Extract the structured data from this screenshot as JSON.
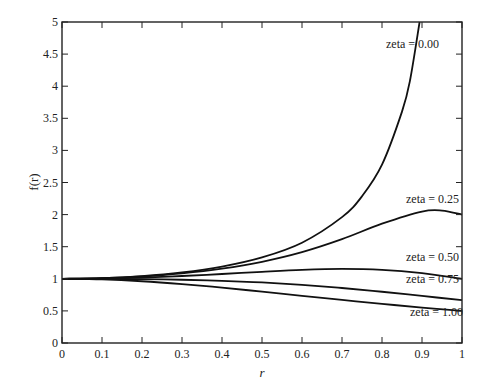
{
  "chart_data": {
    "type": "line",
    "title": "",
    "xlabel": "r",
    "ylabel": "f(r)",
    "xlim": [
      0,
      1
    ],
    "ylim": [
      0,
      5
    ],
    "grid": false,
    "legend": "inline labels near curves (right side)",
    "x_ticks": [
      "0",
      "0.1",
      "0.2",
      "0.3",
      "0.4",
      "0.5",
      "0.6",
      "0.7",
      "0.8",
      "0.9",
      "1"
    ],
    "y_ticks": [
      "0",
      "0.5",
      "1",
      "1.5",
      "2",
      "2.5",
      "3",
      "3.5",
      "4",
      "4.5",
      "5"
    ],
    "x": [
      0,
      0.1,
      0.2,
      0.3,
      0.4,
      0.5,
      0.6,
      0.7,
      0.8,
      0.9,
      1.0
    ],
    "series": [
      {
        "name": "zeta = 0.00",
        "x": [
          0,
          0.1,
          0.2,
          0.3,
          0.4,
          0.5,
          0.6,
          0.7,
          0.75,
          0.8,
          0.85,
          0.87,
          0.894
        ],
        "values": [
          1.0,
          1.0101,
          1.0417,
          1.0989,
          1.1905,
          1.3333,
          1.5625,
          1.9608,
          2.2857,
          2.7778,
          3.6036,
          4.0883,
          5.0
        ]
      },
      {
        "name": "zeta = 0.25",
        "x": [
          0,
          0.1,
          0.2,
          0.3,
          0.4,
          0.5,
          0.6,
          0.7,
          0.8,
          0.9,
          0.95,
          1.0
        ],
        "values": [
          1.0,
          1.0088,
          1.036,
          1.0843,
          1.1581,
          1.2649,
          1.4148,
          1.6167,
          1.8582,
          2.0471,
          2.0624,
          2.0
        ]
      },
      {
        "name": "zeta = 0.50",
        "x": [
          0,
          0.1,
          0.2,
          0.3,
          0.4,
          0.5,
          0.6,
          0.7,
          0.8,
          0.9,
          1.0
        ],
        "values": [
          1.0,
          1.005,
          1.0198,
          1.0437,
          1.0748,
          1.1094,
          1.1399,
          1.1546,
          1.1399,
          1.0872,
          1.0
        ]
      },
      {
        "name": "zeta = 0.75",
        "x": [
          0,
          0.1,
          0.2,
          0.3,
          0.4,
          0.5,
          0.6,
          0.7,
          0.8,
          0.9,
          1.0
        ],
        "values": [
          1.0,
          0.9987,
          0.9942,
          0.985,
          0.9687,
          0.9428,
          0.9055,
          0.8567,
          0.7982,
          0.7335,
          0.6667
        ]
      },
      {
        "name": "zeta = 1.00",
        "x": [
          0,
          0.1,
          0.2,
          0.3,
          0.4,
          0.5,
          0.6,
          0.7,
          0.8,
          0.9,
          1.0
        ],
        "values": [
          1.0,
          0.9901,
          0.9615,
          0.9174,
          0.8621,
          0.8,
          0.7353,
          0.6711,
          0.6098,
          0.5525,
          0.5
        ]
      }
    ],
    "annotations": [
      {
        "text": "zeta = 0.00",
        "x": 0.81,
        "y": 4.6
      },
      {
        "text": "zeta = 0.25",
        "x": 0.86,
        "y": 2.18
      },
      {
        "text": "zeta = 0.50",
        "x": 0.86,
        "y": 1.27
      },
      {
        "text": "zeta = 0.75",
        "x": 0.86,
        "y": 0.94
      },
      {
        "text": "zeta = 1.00",
        "x": 0.87,
        "y": 0.42
      }
    ]
  },
  "axes": {
    "xlabel": "r",
    "ylabel": "f(r)"
  },
  "colors": {
    "line": "#111111",
    "axis": "#222222",
    "background": "#ffffff"
  }
}
